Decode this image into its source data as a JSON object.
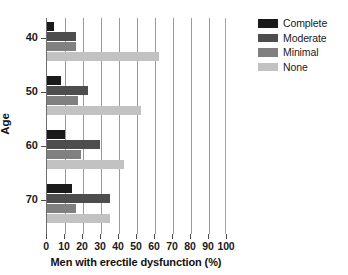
{
  "chart_data": {
    "type": "bar",
    "orientation": "horizontal",
    "title": "",
    "xlabel": "Men with erectile dysfunction (%)",
    "ylabel": "Age",
    "categories": [
      "40",
      "50",
      "60",
      "70"
    ],
    "xlim": [
      0,
      100
    ],
    "xticks": [
      0,
      10,
      20,
      30,
      40,
      50,
      60,
      70,
      80,
      90,
      100
    ],
    "grid": "vertical",
    "legend_position": "right",
    "series": [
      {
        "name": "Complete",
        "color": "#1a1a1a",
        "values": [
          4,
          8,
          10,
          14
        ]
      },
      {
        "name": "Moderate",
        "color": "#4d4d4d",
        "values": [
          16,
          23,
          29.5,
          35
        ]
      },
      {
        "name": "Minimal",
        "color": "#808080",
        "values": [
          16,
          17,
          19,
          16
        ]
      },
      {
        "name": "None",
        "color": "#c2c2c2",
        "values": [
          62,
          52,
          43,
          35
        ]
      }
    ]
  },
  "legend": {
    "items": [
      {
        "label": "Complete"
      },
      {
        "label": "Moderate"
      },
      {
        "label": "Minimal"
      },
      {
        "label": "None"
      }
    ]
  },
  "axes": {
    "x_title": "Men with erectile dysfunction (%)",
    "y_title": "Age",
    "x_tick_labels": [
      "0",
      "10",
      "20",
      "30",
      "40",
      "50",
      "60",
      "70",
      "80",
      "90",
      "100"
    ],
    "y_tick_labels": [
      "40",
      "50",
      "60",
      "70"
    ]
  }
}
